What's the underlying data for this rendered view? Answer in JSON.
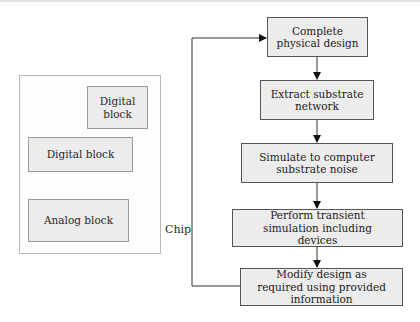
{
  "chip": {
    "label": "Chip",
    "blocks": [
      {
        "label": "Digital\nblock"
      },
      {
        "label": "Digital block"
      },
      {
        "label": "Analog block"
      }
    ]
  },
  "flow": {
    "steps": [
      {
        "label": "Complete physical design"
      },
      {
        "label": "Extract substrate network"
      },
      {
        "label": "Simulate to computer substrate noise"
      },
      {
        "label": "Perform transient simulation including devices"
      },
      {
        "label": "Modify design as required using provided information"
      }
    ]
  }
}
